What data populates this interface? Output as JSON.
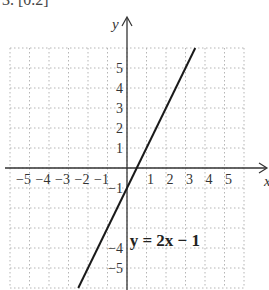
{
  "header": {
    "text": "3. [0.2]"
  },
  "chart_data": {
    "type": "line",
    "title": "",
    "xlabel": "x",
    "ylabel": "y",
    "xlim": [
      -6,
      6
    ],
    "ylim": [
      -6,
      6
    ],
    "grid": true,
    "grid_style": "dotted",
    "x_ticks": [
      -5,
      -4,
      -3,
      -2,
      -1,
      1,
      2,
      3,
      4,
      5
    ],
    "x_tick_labels": [
      "−5",
      "−4",
      "−3",
      "−2",
      "−1",
      "1",
      "2",
      "3",
      "4",
      "5"
    ],
    "y_ticks": [
      5,
      4,
      3,
      2,
      1,
      -1,
      -4,
      -5
    ],
    "y_tick_labels": [
      "5",
      "4",
      "3",
      "2",
      "1",
      "−1",
      "−4",
      "−5"
    ],
    "series": [
      {
        "name": "y = 2x − 1",
        "equation": "y = 2x - 1",
        "slope": 2,
        "intercept": -1,
        "x": [
          -2.5,
          3.5
        ],
        "y": [
          -6,
          6
        ]
      }
    ],
    "annotations": [
      {
        "text": "y = 2x − 1",
        "x": 2.7,
        "y": -3.8
      }
    ],
    "colors": {
      "line": "#1a1a1a",
      "axis": "#333333",
      "grid": "#b5b5b5"
    }
  }
}
